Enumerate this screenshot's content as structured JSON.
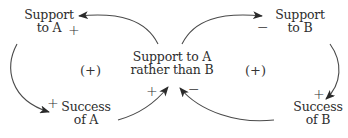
{
  "diagram": {
    "type": "causal-loop-diagram",
    "nodes": {
      "support_a": {
        "line1": "Support",
        "line2": "to A"
      },
      "support_b": {
        "line1": "Support",
        "line2": "to B"
      },
      "center": {
        "line1": "Support to A",
        "line2": "rather than B"
      },
      "success_a": {
        "line1": "Success",
        "line2": "of A"
      },
      "success_b": {
        "line1": "Success",
        "line2": "of B"
      }
    },
    "links": [
      {
        "from": "Support to A rather than B",
        "to": "Support to A",
        "polarity": "+"
      },
      {
        "from": "Support to A rather than B",
        "to": "Support to B",
        "polarity": "−"
      },
      {
        "from": "Support to A",
        "to": "Success of A",
        "polarity": "+"
      },
      {
        "from": "Support to B",
        "to": "Success of B",
        "polarity": "+"
      },
      {
        "from": "Success of A",
        "to": "Support to A rather than B",
        "polarity": "+"
      },
      {
        "from": "Success of B",
        "to": "Support to A rather than B",
        "polarity": "−"
      }
    ],
    "signs": {
      "support_a_in": "+",
      "support_b_in": "−",
      "success_a_in": "+",
      "success_b_in": "+",
      "center_from_a": "+",
      "center_from_b": "−"
    },
    "loops": {
      "left": "(+)",
      "right": "(+)"
    },
    "colors": {
      "line": "#4a4a4a",
      "text": "#2e2e2e"
    }
  }
}
